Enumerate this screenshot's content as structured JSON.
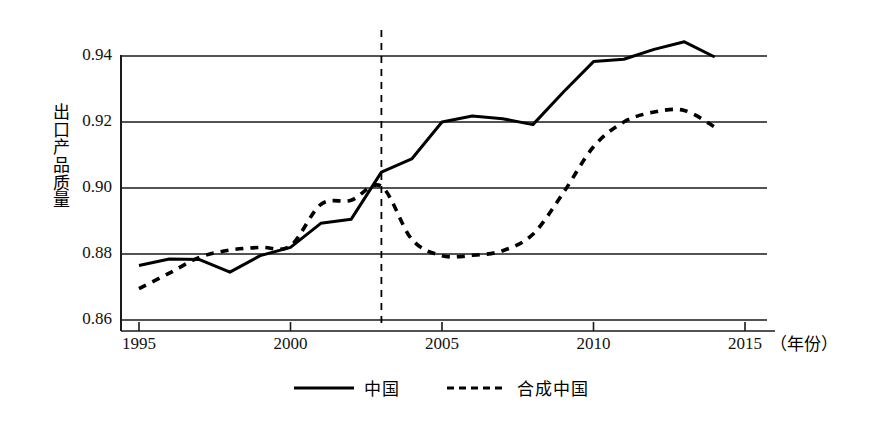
{
  "chart_data": {
    "type": "line",
    "title": "",
    "xlabel": "年份",
    "ylabel": "出口产品质量",
    "xlim": [
      1995,
      2015
    ],
    "ylim": [
      0.86,
      0.945
    ],
    "grid": "horizontal",
    "legend_position": "bottom-center",
    "x_ticks": [
      "1995",
      "2000",
      "2005",
      "2010",
      "2015"
    ],
    "x_tick_values": [
      1995,
      2000,
      2005,
      2010,
      2015
    ],
    "y_ticks": [
      "0.86",
      "0.88",
      "0.90",
      "0.92",
      "0.94"
    ],
    "y_tick_values": [
      0.86,
      0.88,
      0.9,
      0.92,
      0.94
    ],
    "x": [
      1995,
      1996,
      1997,
      1998,
      1999,
      2000,
      2001,
      2002,
      2003,
      2004,
      2005,
      2006,
      2007,
      2008,
      2009,
      2010,
      2011,
      2012,
      2013,
      2014
    ],
    "series": [
      {
        "name": "中国",
        "style": "solid",
        "color": "#000000",
        "values": [
          0.8765,
          0.8785,
          0.8783,
          0.8745,
          0.8795,
          0.882,
          0.8893,
          0.8905,
          0.9048,
          0.9088,
          0.92,
          0.9218,
          0.921,
          0.9192,
          0.929,
          0.9383,
          0.939,
          0.942,
          0.9443,
          0.9397
        ]
      },
      {
        "name": "合成中国",
        "style": "dashed",
        "color": "#000000",
        "values": [
          0.8695,
          0.8742,
          0.879,
          0.8812,
          0.882,
          0.8825,
          0.895,
          0.8963,
          0.9005,
          0.8845,
          0.8795,
          0.8796,
          0.881,
          0.886,
          0.8985,
          0.9125,
          0.92,
          0.923,
          0.9235,
          0.9185
        ]
      }
    ],
    "annotations": [
      {
        "type": "vline",
        "x": 2003,
        "style": "dashed",
        "color": "#000000"
      }
    ]
  },
  "legend": {
    "items": [
      {
        "label": "中国",
        "style": "solid"
      },
      {
        "label": "合成中国",
        "style": "dashed"
      }
    ]
  },
  "axis": {
    "x_unit_label": "（年份）"
  }
}
